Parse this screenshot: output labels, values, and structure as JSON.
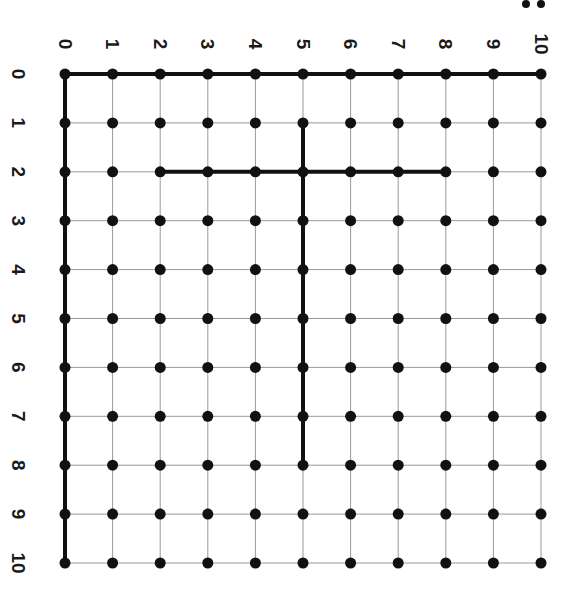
{
  "diagram": {
    "type": "lattice-grid",
    "orientation_note": "image rotated 90 degrees clockwise",
    "columns": [
      0,
      1,
      2,
      3,
      4,
      5,
      6,
      7,
      8,
      9,
      10
    ],
    "rows": [
      0,
      1,
      2,
      3,
      4,
      5,
      6,
      7,
      8,
      9,
      10
    ],
    "column_labels": [
      "0",
      "1",
      "2",
      "3",
      "4",
      "5",
      "6",
      "7",
      "8",
      "9",
      "10"
    ],
    "row_labels": [
      "0",
      "1",
      "2",
      "3",
      "4",
      "5",
      "6",
      "7",
      "8",
      "9",
      "10"
    ],
    "corner_fragment": "..",
    "grid": {
      "origin_x": 65,
      "origin_y": 74,
      "step_x": 47.6,
      "step_y": 48.9,
      "thin_line_color": "#9a9a9a",
      "thick_line_color": "#111111",
      "dot_color": "#111111"
    },
    "thick_segments": [
      {
        "name": "top-axis-row-0",
        "from": [
          0,
          0
        ],
        "to": [
          10,
          0
        ]
      },
      {
        "name": "left-axis-col-0",
        "from": [
          0,
          0
        ],
        "to": [
          0,
          10
        ]
      },
      {
        "name": "row-2-segment",
        "from": [
          2,
          2
        ],
        "to": [
          8,
          2
        ]
      },
      {
        "name": "col-5-segment",
        "from": [
          5,
          1
        ],
        "to": [
          5,
          8
        ]
      }
    ]
  }
}
